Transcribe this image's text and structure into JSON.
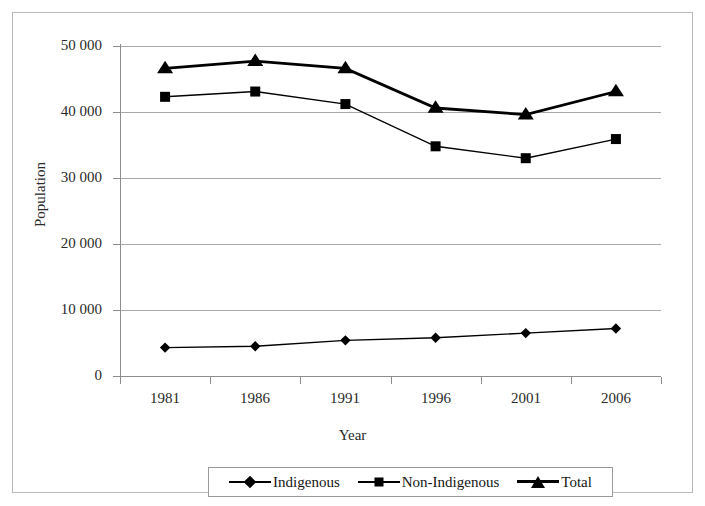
{
  "chart_data": {
    "type": "line",
    "title": "",
    "xlabel": "Year",
    "ylabel": "Population",
    "categories": [
      "1981",
      "1986",
      "1991",
      "1996",
      "2001",
      "2006"
    ],
    "ylim": [
      0,
      50000
    ],
    "ytick_values": [
      0,
      10000,
      20000,
      30000,
      40000,
      50000
    ],
    "ytick_labels": [
      "0",
      "10 000",
      "20 000",
      "30 000",
      "40 000",
      "50 000"
    ],
    "grid": true,
    "legend_position": "bottom",
    "series": [
      {
        "name": "Indigenous",
        "marker": "diamond",
        "color": "#000000",
        "values": [
          4300,
          4500,
          5400,
          5800,
          6500,
          7200
        ]
      },
      {
        "name": "Non-Indigenous",
        "marker": "square",
        "color": "#000000",
        "values": [
          42300,
          43100,
          41200,
          34800,
          33000,
          35900
        ]
      },
      {
        "name": "Total",
        "marker": "triangle",
        "color": "#000000",
        "values": [
          46600,
          47700,
          46600,
          40600,
          39600,
          43100
        ]
      }
    ]
  },
  "legend": {
    "items": [
      {
        "label": "Indigenous",
        "marker": "diamond"
      },
      {
        "label": "Non-Indigenous",
        "marker": "square"
      },
      {
        "label": "Total",
        "marker": "triangle"
      }
    ]
  },
  "axes": {
    "x_title": "Year",
    "y_title": "Population"
  }
}
